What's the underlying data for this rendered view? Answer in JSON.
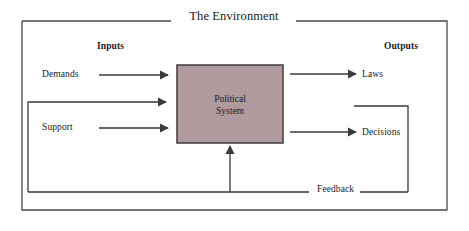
{
  "diagram": {
    "title": "The Environment",
    "type": "systems-model",
    "headings": {
      "inputs": "Inputs",
      "outputs": "Outputs"
    },
    "process_box": {
      "label_line1": "Political",
      "label_line2": "System",
      "fill_color": "#b09a9e",
      "border_color": "#4a4448"
    },
    "inputs": [
      {
        "label": "Demands"
      },
      {
        "label": "Support"
      }
    ],
    "outputs": [
      {
        "label": "Laws"
      },
      {
        "label": "Decisions"
      }
    ],
    "feedback": {
      "label": "Feedback"
    },
    "colors": {
      "line": "#3a3a3a",
      "outer_border": "#4a4a4a",
      "text": "#1a1a1a",
      "background": "#ffffff"
    }
  }
}
